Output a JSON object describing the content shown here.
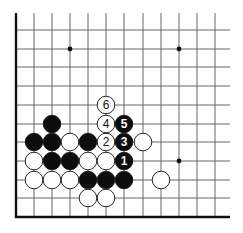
{
  "diagram": {
    "type": "go-board-fragment",
    "corner": "bottom-left",
    "grid": {
      "columns_x": [
        16,
        34,
        52,
        70,
        88,
        106,
        124,
        143,
        161,
        179,
        197,
        215
      ],
      "rows_y": [
        30,
        49,
        67,
        86,
        105,
        124,
        142,
        161,
        180,
        198
      ],
      "left_edge_x": 16,
      "bottom_edge_y": 217,
      "top_extent_y": 13,
      "right_extent_x": 230
    },
    "star_points": [
      {
        "x": 70,
        "y": 49
      },
      {
        "x": 179,
        "y": 49
      },
      {
        "x": 179,
        "y": 161
      }
    ],
    "stones": [
      {
        "color": "white",
        "x": 106,
        "y": 105,
        "label": "6"
      },
      {
        "color": "black",
        "x": 52,
        "y": 124,
        "label": ""
      },
      {
        "color": "white",
        "x": 106,
        "y": 124,
        "label": "4"
      },
      {
        "color": "black",
        "x": 124,
        "y": 124,
        "label": "5"
      },
      {
        "color": "black",
        "x": 34,
        "y": 142,
        "label": ""
      },
      {
        "color": "black",
        "x": 52,
        "y": 142,
        "label": ""
      },
      {
        "color": "white",
        "x": 70,
        "y": 142,
        "label": ""
      },
      {
        "color": "black",
        "x": 88,
        "y": 142,
        "label": ""
      },
      {
        "color": "white",
        "x": 106,
        "y": 142,
        "label": "2"
      },
      {
        "color": "black",
        "x": 124,
        "y": 142,
        "label": "3"
      },
      {
        "color": "white",
        "x": 143,
        "y": 142,
        "label": ""
      },
      {
        "color": "white",
        "x": 34,
        "y": 161,
        "label": ""
      },
      {
        "color": "black",
        "x": 52,
        "y": 161,
        "label": ""
      },
      {
        "color": "black",
        "x": 70,
        "y": 161,
        "label": ""
      },
      {
        "color": "white",
        "x": 88,
        "y": 161,
        "label": ""
      },
      {
        "color": "white",
        "x": 106,
        "y": 161,
        "label": ""
      },
      {
        "color": "black",
        "x": 124,
        "y": 161,
        "label": "1"
      },
      {
        "color": "white",
        "x": 34,
        "y": 180,
        "label": ""
      },
      {
        "color": "white",
        "x": 52,
        "y": 180,
        "label": ""
      },
      {
        "color": "white",
        "x": 70,
        "y": 180,
        "label": ""
      },
      {
        "color": "black",
        "x": 88,
        "y": 180,
        "label": ""
      },
      {
        "color": "black",
        "x": 106,
        "y": 180,
        "label": ""
      },
      {
        "color": "black",
        "x": 124,
        "y": 180,
        "label": ""
      },
      {
        "color": "white",
        "x": 161,
        "y": 180,
        "label": ""
      },
      {
        "color": "white",
        "x": 88,
        "y": 198,
        "label": ""
      },
      {
        "color": "white",
        "x": 106,
        "y": 198,
        "label": ""
      }
    ],
    "stone_radius": 8.8,
    "colors": {
      "black_stone": "#0d0d0d",
      "white_stone": "#ffffff",
      "line": "#555555",
      "edge": "#111111"
    }
  }
}
